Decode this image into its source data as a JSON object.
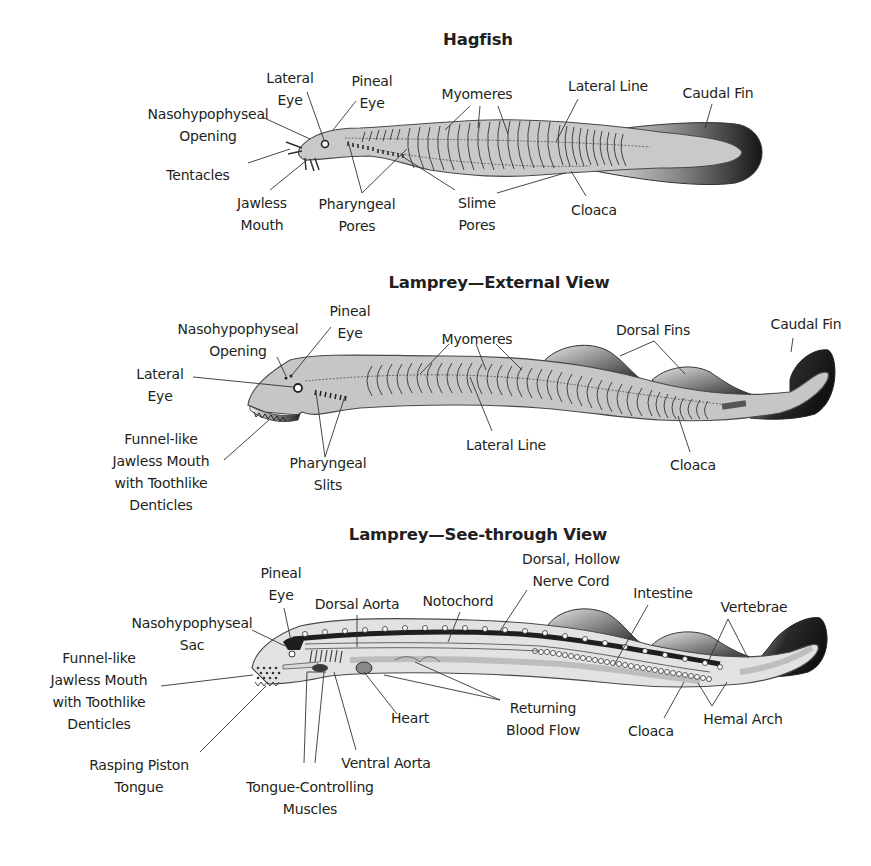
{
  "figure": {
    "panels": [
      {
        "id": "hagfish",
        "title": "Hagfish",
        "title_pos": [
          478,
          30
        ],
        "labels": [
          {
            "id": "lateral-eye",
            "lines": [
              "Lateral",
              "Eye"
            ],
            "x": 290,
            "y": 67
          },
          {
            "id": "pineal-eye",
            "lines": [
              "Pineal",
              "Eye"
            ],
            "x": 372,
            "y": 70
          },
          {
            "id": "nasohypophyseal-opening",
            "lines": [
              "Nasohypophyseal",
              "Opening"
            ],
            "x": 208,
            "y": 103
          },
          {
            "id": "myomeres",
            "lines": [
              "Myomeres"
            ],
            "x": 477,
            "y": 83
          },
          {
            "id": "lateral-line",
            "lines": [
              "Lateral Line"
            ],
            "x": 608,
            "y": 75
          },
          {
            "id": "caudal-fin",
            "lines": [
              "Caudal Fin"
            ],
            "x": 718,
            "y": 82
          },
          {
            "id": "tentacles",
            "lines": [
              "Tentacles"
            ],
            "x": 198,
            "y": 164
          },
          {
            "id": "jawless-mouth",
            "lines": [
              "Jawless",
              "Mouth"
            ],
            "x": 262,
            "y": 192
          },
          {
            "id": "pharyngeal-pores",
            "lines": [
              "Pharyngeal",
              "Pores"
            ],
            "x": 357,
            "y": 193
          },
          {
            "id": "slime-pores",
            "lines": [
              "Slime",
              "Pores"
            ],
            "x": 477,
            "y": 192
          },
          {
            "id": "cloaca",
            "lines": [
              "Cloaca"
            ],
            "x": 594,
            "y": 199
          }
        ]
      },
      {
        "id": "lamprey-external",
        "title": "Lamprey—External View",
        "title_pos": [
          499,
          273
        ],
        "labels": [
          {
            "id": "pineal-eye",
            "lines": [
              "Pineal",
              "Eye"
            ],
            "x": 350,
            "y": 300
          },
          {
            "id": "nasohypophyseal-opening",
            "lines": [
              "Nasohypophyseal",
              "Opening"
            ],
            "x": 238,
            "y": 318
          },
          {
            "id": "myomeres",
            "lines": [
              "Myomeres"
            ],
            "x": 477,
            "y": 328
          },
          {
            "id": "dorsal-fins",
            "lines": [
              "Dorsal Fins"
            ],
            "x": 653,
            "y": 319
          },
          {
            "id": "caudal-fin",
            "lines": [
              "Caudal Fin"
            ],
            "x": 806,
            "y": 313
          },
          {
            "id": "lateral-eye",
            "lines": [
              "Lateral",
              "Eye"
            ],
            "x": 160,
            "y": 363
          },
          {
            "id": "funnel-mouth",
            "lines": [
              "Funnel-like",
              "Jawless Mouth",
              "with Toothlike",
              "Denticles"
            ],
            "x": 161,
            "y": 428
          },
          {
            "id": "pharyngeal-slits",
            "lines": [
              "Pharyngeal",
              "Slits"
            ],
            "x": 328,
            "y": 452
          },
          {
            "id": "lateral-line",
            "lines": [
              "Lateral Line"
            ],
            "x": 506,
            "y": 434
          },
          {
            "id": "cloaca",
            "lines": [
              "Cloaca"
            ],
            "x": 693,
            "y": 454
          }
        ]
      },
      {
        "id": "lamprey-see-through",
        "title": "Lamprey—See-through View",
        "title_pos": [
          478,
          525
        ],
        "labels": [
          {
            "id": "dorsal-hollow-nerve-cord",
            "lines": [
              "Dorsal, Hollow",
              "Nerve Cord"
            ],
            "x": 571,
            "y": 548
          },
          {
            "id": "pineal-eye",
            "lines": [
              "Pineal",
              "Eye"
            ],
            "x": 281,
            "y": 562
          },
          {
            "id": "intestine",
            "lines": [
              "Intestine"
            ],
            "x": 663,
            "y": 582
          },
          {
            "id": "dorsal-aorta",
            "lines": [
              "Dorsal Aorta"
            ],
            "x": 357,
            "y": 593
          },
          {
            "id": "notochord",
            "lines": [
              "Notochord"
            ],
            "x": 458,
            "y": 590
          },
          {
            "id": "vertebrae",
            "lines": [
              "Vertebrae"
            ],
            "x": 754,
            "y": 596
          },
          {
            "id": "nasohypophyseal-sac",
            "lines": [
              "Nasohypophyseal",
              "Sac"
            ],
            "x": 192,
            "y": 612
          },
          {
            "id": "funnel-mouth",
            "lines": [
              "Funnel-like",
              "Jawless Mouth",
              "with Toothlike",
              "Denticles"
            ],
            "x": 99,
            "y": 647
          },
          {
            "id": "returning-blood-flow",
            "lines": [
              "Returning",
              "Blood Flow"
            ],
            "x": 543,
            "y": 697
          },
          {
            "id": "heart",
            "lines": [
              "Heart"
            ],
            "x": 410,
            "y": 707
          },
          {
            "id": "hemal-arch",
            "lines": [
              "Hemal Arch"
            ],
            "x": 743,
            "y": 708
          },
          {
            "id": "cloaca",
            "lines": [
              "Cloaca"
            ],
            "x": 651,
            "y": 720
          },
          {
            "id": "ventral-aorta",
            "lines": [
              "Ventral Aorta"
            ],
            "x": 386,
            "y": 752
          },
          {
            "id": "rasping-piston-tongue",
            "lines": [
              "Rasping Piston",
              "Tongue"
            ],
            "x": 139,
            "y": 754
          },
          {
            "id": "tongue-controlling-muscles",
            "lines": [
              "Tongue-Controlling",
              "Muscles"
            ],
            "x": 310,
            "y": 776
          }
        ]
      }
    ],
    "colors": {
      "body_fill": "#c9c9c9",
      "body_stroke": "#4a4a4a",
      "fin_dark": "#1f1f1f",
      "fin_light": "#d8d8d8",
      "see_through_fill": "#e2e2e2",
      "notochord": "#1e1e1e",
      "text": "#231f20"
    }
  }
}
